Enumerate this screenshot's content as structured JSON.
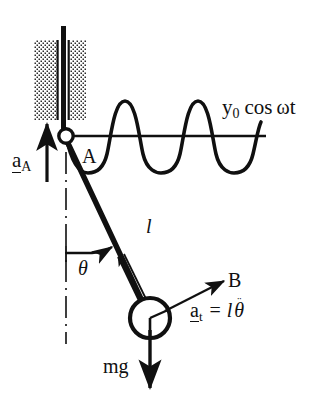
{
  "figure": {
    "type": "physics-free-body-diagram",
    "width": 328,
    "height": 399,
    "background_color": "#ffffff",
    "ink_color": "#101010"
  },
  "labels": {
    "wave_equation": {
      "y": "y",
      "subscript": "0",
      "cos": "cos",
      "omega": "ω",
      "t": "t",
      "full": "y0 cos ωt"
    },
    "support_acceleration": {
      "symbol": "a",
      "subscript": "A",
      "full": "a_A",
      "notation": "underlined-vector"
    },
    "pivot_point": "A",
    "angle": "θ",
    "rod_length": "l",
    "bob_point": "B",
    "tangential_acceleration": {
      "symbol": "a",
      "subscript": "t",
      "equals": "=",
      "length": "l",
      "theta_ddot": "θ",
      "dots": "¨",
      "full": "a_t = l θ̈",
      "notation": "underlined-vector"
    },
    "weight": "mg"
  },
  "elements": {
    "wall_hatch_left": "stipple-pattern-block",
    "wall_hatch_right": "stipple-pattern-block",
    "vertical_rod": "support-rod",
    "pivot_circle": "hinge-joint",
    "pendulum_rod": "rigid-rod",
    "pendulum_bob": "point-mass-circle",
    "vertical_dashed_reference": "dash-dot-reference-line",
    "wave_axis": "horizontal-axis-line",
    "wave_curve": "cosine-curve",
    "arrow_aA": "up-arrow",
    "arrow_at": "diagonal-arrow",
    "arrow_mg": "down-arrow",
    "arrow_angle": "arc-arrow",
    "arrow_rod_direction": "double-line-arrow"
  },
  "geometry": {
    "pivot": {
      "x": 66,
      "y": 136
    },
    "bob": {
      "x": 150,
      "y": 318,
      "radius": 20
    },
    "rod_angle_deg": 25,
    "wave": {
      "axis_y": 136,
      "axis_x_start": 66,
      "axis_x_end": 266,
      "amplitude": 35,
      "wavelength": 72,
      "peaks_x": [
        125,
        198
      ],
      "troughs_x": [
        88,
        160,
        233
      ]
    },
    "hatch_left": {
      "x": 35,
      "y": 40,
      "w": 22,
      "h": 80
    },
    "hatch_right": {
      "x": 70,
      "y": 40,
      "w": 16,
      "h": 80
    }
  }
}
